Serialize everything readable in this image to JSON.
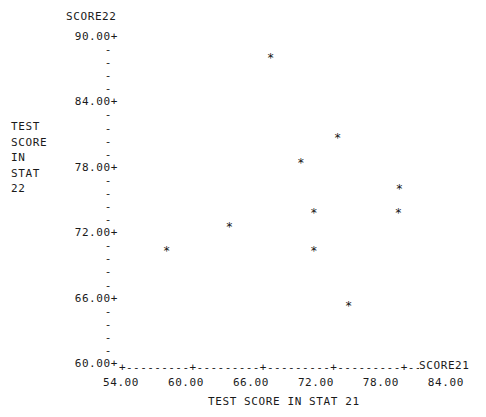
{
  "chart_data": {
    "type": "scatter",
    "title": "",
    "xlabel": "TEST SCORE IN STAT 21",
    "ylabel": "TEST SCORE IN STAT 22",
    "x_axis_name": "SCORE21",
    "y_axis_name": "SCORE22",
    "xlim": [
      54.0,
      84.0
    ],
    "ylim": [
      60.0,
      90.0
    ],
    "x_ticks": [
      "54.00",
      "60.00",
      "66.00",
      "72.00",
      "78.00",
      "84.00"
    ],
    "y_ticks": [
      "90.00+",
      "84.00+",
      "78.00+",
      "72.00+",
      "66.00+",
      "60.00+"
    ],
    "y_minor_tick_glyph": "-",
    "y_minor_ticks_between_majors": 4,
    "point_marker": "*",
    "grid": false,
    "legend": false,
    "axis_line_style": "dashed-plus",
    "point_color": "#141414",
    "axis_color": "#1a1a1a",
    "background_color": "#ffffff",
    "points": [
      {
        "x": 67.8,
        "y": 87.9
      },
      {
        "x": 74.0,
        "y": 80.6
      },
      {
        "x": 70.6,
        "y": 78.3
      },
      {
        "x": 79.7,
        "y": 75.9
      },
      {
        "x": 79.6,
        "y": 73.7
      },
      {
        "x": 71.8,
        "y": 73.7
      },
      {
        "x": 64.0,
        "y": 72.4
      },
      {
        "x": 58.2,
        "y": 70.2
      },
      {
        "x": 71.8,
        "y": 70.2
      },
      {
        "x": 75.0,
        "y": 65.2
      }
    ]
  },
  "y_caption_lines": [
    "TEST",
    "SCORE",
    "IN",
    "STAT",
    "22"
  ],
  "x_axis_line_text": "+---------+---------+---------+---------+------"
}
